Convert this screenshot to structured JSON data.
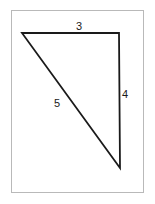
{
  "figure": {
    "background_color": "#ffffff",
    "frame": {
      "name": "image-border",
      "color": "#b9b9b9",
      "x": 11,
      "y": 10,
      "width": 133,
      "height": 183
    },
    "stroke_color": "#1a1a1a",
    "stroke_width": 1.8,
    "vertices": {
      "top_left": {
        "x": 22,
        "y": 33
      },
      "top_right": {
        "x": 119,
        "y": 33
      },
      "bottom_right": {
        "x": 120,
        "y": 168
      }
    },
    "labels": {
      "top": "3",
      "right": "4",
      "hypotenuse": "5"
    }
  },
  "chart_data": {
    "type": "diagram",
    "shape": "right-triangle",
    "sides": [
      {
        "name": "top",
        "label": "3",
        "length": 3,
        "from": "top_left",
        "to": "top_right",
        "orientation": "horizontal"
      },
      {
        "name": "right",
        "label": "4",
        "length": 4,
        "from": "top_right",
        "to": "bottom_right",
        "orientation": "vertical"
      },
      {
        "name": "hypotenuse",
        "label": "5",
        "length": 5,
        "from": "top_left",
        "to": "bottom_right",
        "orientation": "diagonal"
      }
    ],
    "right_angle_at": "top_right",
    "annotations": [
      "3",
      "4",
      "5"
    ]
  }
}
